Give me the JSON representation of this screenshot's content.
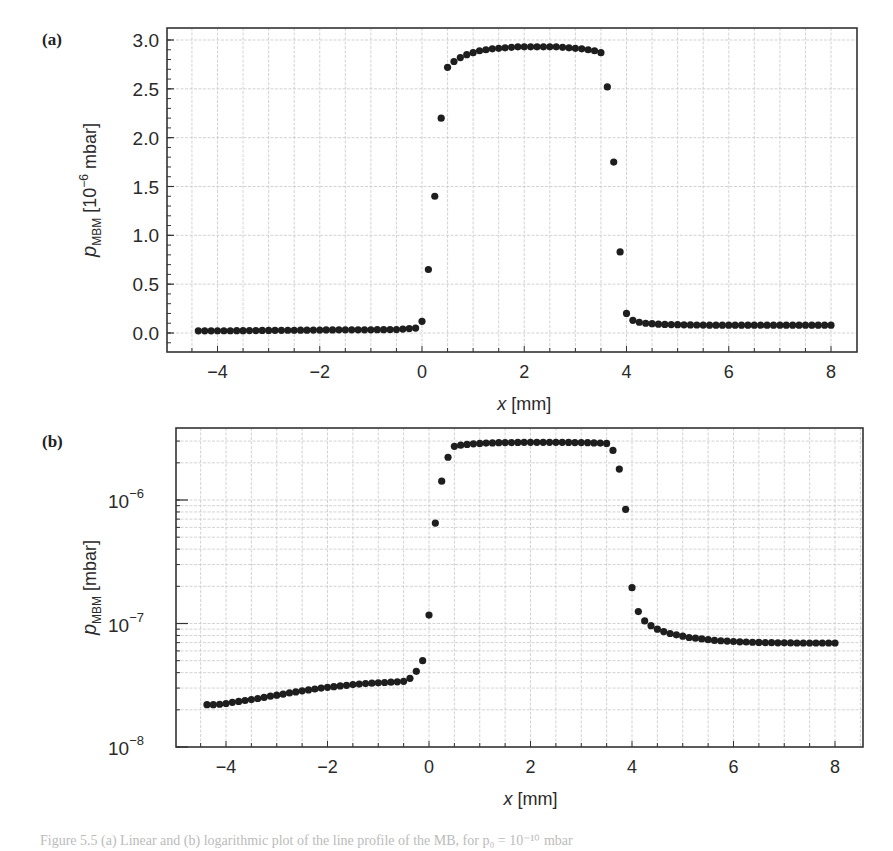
{
  "figure": {
    "panels": [
      {
        "label": "(a)"
      },
      {
        "label": "(b)"
      }
    ],
    "caption": "Figure 5.5  (a) Linear and (b) logarithmic plot of the line profile of the MB, for p₀ = 10⁻¹⁰ mbar"
  },
  "colors": {
    "marker": "#1e1e1e",
    "axis": "#333333",
    "grid": "#c8c8c8",
    "background": "#ffffff"
  },
  "chart_data": [
    {
      "type": "scatter",
      "panel": "(a)",
      "title": "",
      "xlabel": "x [mm]",
      "ylabel": "p_MBM [10^-6 mbar]",
      "xlim": [
        -4.8,
        8.5
      ],
      "ylim": [
        -0.2,
        3.1
      ],
      "xticks": [
        -4,
        -2,
        0,
        2,
        4,
        6,
        8
      ],
      "xtick_labels": [
        "−4",
        "−2",
        "0",
        "2",
        "4",
        "6",
        "8"
      ],
      "yticks": [
        0.0,
        0.5,
        1.0,
        1.5,
        2.0,
        2.5,
        3.0
      ],
      "ytick_labels": [
        "0.0",
        "0.5",
        "1.0",
        "1.5",
        "2.0",
        "2.5",
        "3.0"
      ],
      "grid": true,
      "yscale": "linear",
      "x": [
        -4.375,
        -4.25,
        -4.125,
        -4.0,
        -3.875,
        -3.75,
        -3.625,
        -3.5,
        -3.375,
        -3.25,
        -3.125,
        -3.0,
        -2.875,
        -2.75,
        -2.625,
        -2.5,
        -2.375,
        -2.25,
        -2.125,
        -2.0,
        -1.875,
        -1.75,
        -1.625,
        -1.5,
        -1.375,
        -1.25,
        -1.125,
        -1.0,
        -0.875,
        -0.75,
        -0.625,
        -0.5,
        -0.375,
        -0.25,
        -0.125,
        0.0,
        0.125,
        0.25,
        0.375,
        0.5,
        0.625,
        0.75,
        0.875,
        1.0,
        1.125,
        1.25,
        1.375,
        1.5,
        1.625,
        1.75,
        1.875,
        2.0,
        2.125,
        2.25,
        2.375,
        2.5,
        2.625,
        2.75,
        2.875,
        3.0,
        3.125,
        3.25,
        3.375,
        3.5,
        3.625,
        3.75,
        3.875,
        4.0,
        4.125,
        4.25,
        4.375,
        4.5,
        4.625,
        4.75,
        4.875,
        5.0,
        5.125,
        5.25,
        5.375,
        5.5,
        5.625,
        5.75,
        5.875,
        6.0,
        6.125,
        6.25,
        6.375,
        6.5,
        6.625,
        6.75,
        6.875,
        7.0,
        7.125,
        7.25,
        7.375,
        7.5,
        7.625,
        7.75,
        7.875,
        8.0
      ],
      "y": [
        0.022,
        0.022,
        0.022,
        0.023,
        0.023,
        0.023,
        0.024,
        0.024,
        0.025,
        0.025,
        0.026,
        0.026,
        0.027,
        0.027,
        0.028,
        0.028,
        0.029,
        0.029,
        0.03,
        0.03,
        0.031,
        0.031,
        0.032,
        0.032,
        0.032,
        0.033,
        0.033,
        0.033,
        0.034,
        0.034,
        0.035,
        0.035,
        0.04,
        0.045,
        0.05,
        0.12,
        0.65,
        1.4,
        2.2,
        2.72,
        2.78,
        2.82,
        2.85,
        2.87,
        2.89,
        2.9,
        2.91,
        2.915,
        2.92,
        2.925,
        2.93,
        2.93,
        2.93,
        2.93,
        2.93,
        2.93,
        2.93,
        2.925,
        2.92,
        2.915,
        2.91,
        2.9,
        2.89,
        2.87,
        2.52,
        1.75,
        0.83,
        0.2,
        0.13,
        0.11,
        0.1,
        0.095,
        0.09,
        0.088,
        0.086,
        0.085,
        0.084,
        0.083,
        0.082,
        0.081,
        0.08,
        0.08,
        0.08,
        0.08,
        0.08,
        0.08,
        0.08,
        0.08,
        0.08,
        0.08,
        0.08,
        0.08,
        0.08,
        0.08,
        0.08,
        0.08,
        0.08,
        0.08,
        0.08,
        0.08
      ]
    },
    {
      "type": "scatter",
      "panel": "(b)",
      "title": "",
      "xlabel": "x [mm]",
      "ylabel": "p_MBM [mbar]",
      "xlim": [
        -4.8,
        8.5
      ],
      "ylim": [
        1e-08,
        3.8e-06
      ],
      "xticks": [
        -4,
        -2,
        0,
        2,
        4,
        6,
        8
      ],
      "xtick_labels": [
        "−4",
        "−2",
        "0",
        "2",
        "4",
        "6",
        "8"
      ],
      "yticks": [
        1e-08,
        1e-07,
        1e-06
      ],
      "ytick_labels": [
        "10⁻⁸",
        "10⁻⁷",
        "10⁻⁶"
      ],
      "grid": true,
      "yscale": "log",
      "x": [
        -4.375,
        -4.25,
        -4.125,
        -4.0,
        -3.875,
        -3.75,
        -3.625,
        -3.5,
        -3.375,
        -3.25,
        -3.125,
        -3.0,
        -2.875,
        -2.75,
        -2.625,
        -2.5,
        -2.375,
        -2.25,
        -2.125,
        -2.0,
        -1.875,
        -1.75,
        -1.625,
        -1.5,
        -1.375,
        -1.25,
        -1.125,
        -1.0,
        -0.875,
        -0.75,
        -0.625,
        -0.5,
        -0.375,
        -0.25,
        -0.125,
        0.0,
        0.125,
        0.25,
        0.375,
        0.5,
        0.625,
        0.75,
        0.875,
        1.0,
        1.125,
        1.25,
        1.375,
        1.5,
        1.625,
        1.75,
        1.875,
        2.0,
        2.125,
        2.25,
        2.375,
        2.5,
        2.625,
        2.75,
        2.875,
        3.0,
        3.125,
        3.25,
        3.375,
        3.5,
        3.625,
        3.75,
        3.875,
        4.0,
        4.125,
        4.25,
        4.375,
        4.5,
        4.625,
        4.75,
        4.875,
        5.0,
        5.125,
        5.25,
        5.375,
        5.5,
        5.625,
        5.75,
        5.875,
        6.0,
        6.125,
        6.25,
        6.375,
        6.5,
        6.625,
        6.75,
        6.875,
        7.0,
        7.125,
        7.25,
        7.375,
        7.5,
        7.625,
        7.75,
        7.875,
        8.0
      ],
      "y": [
        2.2e-08,
        2.2e-08,
        2.22e-08,
        2.25e-08,
        2.3e-08,
        2.34e-08,
        2.38e-08,
        2.42e-08,
        2.47e-08,
        2.52e-08,
        2.58e-08,
        2.63e-08,
        2.68e-08,
        2.74e-08,
        2.79e-08,
        2.85e-08,
        2.9e-08,
        2.95e-08,
        3e-08,
        3.04e-08,
        3.08e-08,
        3.12e-08,
        3.16e-08,
        3.2e-08,
        3.23e-08,
        3.26e-08,
        3.29e-08,
        3.31e-08,
        3.33e-08,
        3.35e-08,
        3.37e-08,
        3.4e-08,
        3.6e-08,
        4.1e-08,
        5e-08,
        1.17e-07,
        6.5e-07,
        1.42e-06,
        2.22e-06,
        2.72e-06,
        2.78e-06,
        2.82e-06,
        2.85e-06,
        2.87e-06,
        2.89e-06,
        2.9e-06,
        2.91e-06,
        2.915e-06,
        2.92e-06,
        2.925e-06,
        2.93e-06,
        2.93e-06,
        2.93e-06,
        2.93e-06,
        2.93e-06,
        2.93e-06,
        2.93e-06,
        2.925e-06,
        2.92e-06,
        2.915e-06,
        2.91e-06,
        2.9e-06,
        2.89e-06,
        2.87e-06,
        2.52e-06,
        1.78e-06,
        8.4e-07,
        1.95e-07,
        1.25e-07,
        1.05e-07,
        9.6e-08,
        9e-08,
        8.6e-08,
        8.3e-08,
        8.1e-08,
        7.9e-08,
        7.7e-08,
        7.6e-08,
        7.5e-08,
        7.4e-08,
        7.3e-08,
        7.25e-08,
        7.2e-08,
        7.15e-08,
        7.1e-08,
        7.08e-08,
        7.05e-08,
        7.03e-08,
        7e-08,
        7e-08,
        6.98e-08,
        6.97e-08,
        6.96e-08,
        6.95e-08,
        6.95e-08,
        6.95e-08,
        6.95e-08,
        6.95e-08,
        6.95e-08,
        6.95e-08
      ]
    }
  ]
}
